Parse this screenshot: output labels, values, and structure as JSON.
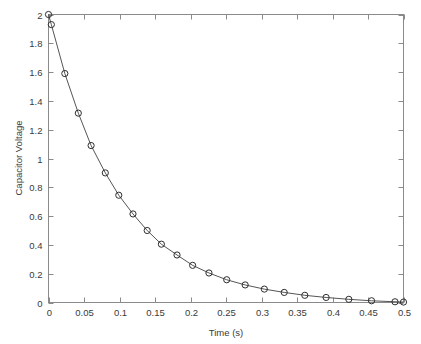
{
  "chart_data": {
    "type": "line",
    "title": "",
    "xlabel": "Time (s)",
    "ylabel": "Capacitor Voltage",
    "xlim": [
      0,
      0.5
    ],
    "ylim": [
      0,
      2
    ],
    "grid": false,
    "legend": null,
    "xticks": [
      0,
      0.05,
      0.1,
      0.15,
      0.2,
      0.25,
      0.3,
      0.35,
      0.4,
      0.45,
      0.5
    ],
    "xtick_labels": [
      "0",
      "0.05",
      "0.1",
      "0.15",
      "0.2",
      "0.25",
      "0.3",
      "0.35",
      "0.4",
      "0.45",
      "0.5"
    ],
    "yticks": [
      0,
      0.2,
      0.4,
      0.6,
      0.8,
      1,
      1.2,
      1.4,
      1.6,
      1.8,
      2
    ],
    "ytick_labels": [
      "0",
      "0.2",
      "0.4",
      "0.6",
      "0.8",
      "1",
      "1.2",
      "1.4",
      "1.6",
      "1.8",
      "2"
    ],
    "marker": "circle-open",
    "line_color": "#555555",
    "marker_color": "#2e2e2e",
    "axis_color": "#8a8a8a",
    "background_color": "#ffffff",
    "series": [
      {
        "name": "Capacitor Voltage",
        "x": [
          0.0,
          0.004,
          0.023,
          0.042,
          0.06,
          0.08,
          0.099,
          0.119,
          0.139,
          0.159,
          0.181,
          0.203,
          0.226,
          0.251,
          0.277,
          0.304,
          0.332,
          0.361,
          0.391,
          0.423,
          0.455,
          0.488,
          0.5
        ],
        "y": [
          2.0,
          1.93,
          1.59,
          1.315,
          1.09,
          0.9,
          0.745,
          0.615,
          0.5,
          0.405,
          0.33,
          0.258,
          0.205,
          0.158,
          0.122,
          0.093,
          0.07,
          0.05,
          0.035,
          0.022,
          0.012,
          0.005,
          0.003
        ]
      }
    ]
  },
  "axes": {
    "x_axis_name": "time-axis",
    "y_axis_name": "voltage-axis"
  }
}
